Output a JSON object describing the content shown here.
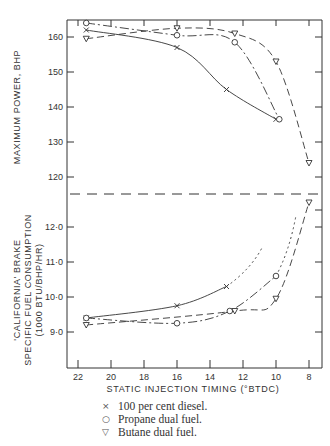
{
  "chart_data": [
    {
      "type": "line",
      "title": "",
      "xlabel": "STATIC INJECTION TIMING (°BTDC)",
      "ylabel": "MAXIMUM POWER, BHP",
      "xlim": [
        22,
        8
      ],
      "x_reversed": true,
      "ylim": [
        115,
        165
      ],
      "x_ticks": [
        22,
        20,
        18,
        16,
        14,
        12,
        10,
        8
      ],
      "y_ticks": [
        120,
        130,
        140,
        150,
        160
      ],
      "grid": false,
      "series": [
        {
          "name": "100 per cent diesel.",
          "marker": "x",
          "linestyle": "solid",
          "points": [
            [
              21.5,
              162
            ],
            [
              16,
              157
            ],
            [
              13,
              145
            ],
            [
              10,
              136.5
            ]
          ]
        },
        {
          "name": "Propane dual fuel.",
          "marker": "o",
          "linestyle": "dashdot",
          "points": [
            [
              21.5,
              164
            ],
            [
              16,
              160.5
            ],
            [
              12.5,
              158.5
            ],
            [
              9.8,
              136.5
            ]
          ]
        },
        {
          "name": "Butane dual fuel.",
          "marker": "v",
          "linestyle": "dashed",
          "points": [
            [
              21.5,
              159.5
            ],
            [
              16,
              162.5
            ],
            [
              12.5,
              161
            ],
            [
              10,
              153
            ],
            [
              8,
              124
            ]
          ]
        }
      ]
    },
    {
      "type": "line",
      "title": "",
      "xlabel": "STATIC INJECTION TIMING (°BTDC)",
      "ylabel": "'CALIFORNIA' BRAKE SPECIFIC FUEL CONSUMPTION (1000 BTU/BHP/HR)",
      "xlim": [
        22,
        8
      ],
      "x_reversed": true,
      "ylim": [
        8.0,
        12.5
      ],
      "x_ticks": [
        22,
        20,
        18,
        16,
        14,
        12,
        10,
        8
      ],
      "y_ticks": [
        9.0,
        10.0,
        11.0,
        12.0
      ],
      "grid": false,
      "series": [
        {
          "name": "100 per cent diesel.",
          "marker": "x",
          "linestyle": "solid",
          "points": [
            [
              21.5,
              9.4
            ],
            [
              16,
              9.75
            ],
            [
              13,
              10.3
            ]
          ]
        },
        {
          "name": "Propane dual fuel.",
          "marker": "o",
          "linestyle": "dashdot",
          "points": [
            [
              21.5,
              9.4
            ],
            [
              16,
              9.25
            ],
            [
              12.8,
              9.6
            ],
            [
              10,
              10.6
            ]
          ]
        },
        {
          "name": "Butane dual fuel.",
          "marker": "v",
          "linestyle": "dashed",
          "points": [
            [
              21.5,
              9.2
            ],
            [
              12.5,
              9.6
            ],
            [
              10,
              9.95
            ],
            [
              8,
              12.7
            ]
          ]
        }
      ]
    }
  ],
  "labels": {
    "upper_ylabel": "MAXIMUM POWER, BHP",
    "lower_ylabel_1": "'CALIFORNIA' BRAKE",
    "lower_ylabel_2": "SPECIFIC FUEL CONSUMPTION",
    "lower_ylabel_3": "(1000 BTU/BHP/HR)",
    "xlabel": "STATIC INJECTION TIMING (°BTDC)",
    "upper_ticks": [
      "160",
      "150",
      "140",
      "130",
      "120"
    ],
    "lower_ticks": [
      "12·0",
      "11·0",
      "10·0",
      "9·0"
    ],
    "x_ticks": [
      "22",
      "20",
      "18",
      "16",
      "14",
      "12",
      "10",
      "8"
    ]
  },
  "legend": [
    {
      "symbol": "×",
      "label": "100 per cent diesel."
    },
    {
      "symbol": "○",
      "label": "Propane dual fuel."
    },
    {
      "symbol": "▽",
      "label": "Butane dual fuel."
    }
  ]
}
